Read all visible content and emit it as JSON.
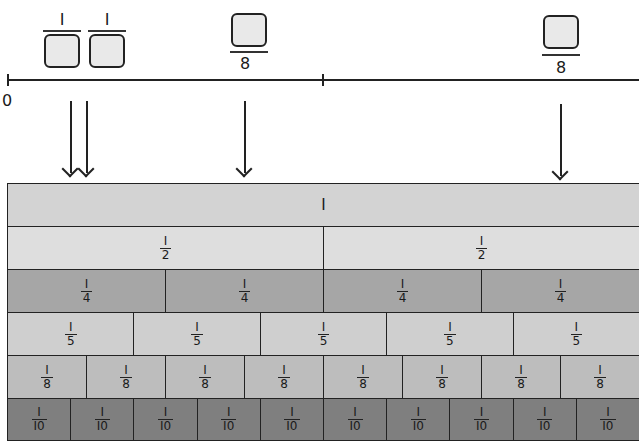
{
  "number_line": {
    "start_label": "0",
    "labels_above": [
      {
        "type": "unit-fraction-unknown-denominator",
        "numerator": "I",
        "x": 62
      },
      {
        "type": "unit-fraction-unknown-denominator",
        "numerator": "I",
        "x": 107
      },
      {
        "type": "unknown-numerator-eighths",
        "denominator": "8",
        "x": 244
      },
      {
        "type": "unknown-numerator-eighths",
        "denominator": "8",
        "x": 560
      }
    ]
  },
  "fraction_wall": {
    "rows": [
      {
        "label": "I",
        "count": 1,
        "color": "#d3d3d3",
        "denominator": ""
      },
      {
        "label": "I",
        "count": 2,
        "color": "#dedede",
        "denominator": "2"
      },
      {
        "label": "I",
        "count": 4,
        "color": "#a6a6a6",
        "denominator": "4"
      },
      {
        "label": "I",
        "count": 5,
        "color": "#cfcfcf",
        "denominator": "5"
      },
      {
        "label": "I",
        "count": 8,
        "color": "#bdbdbd",
        "denominator": "8"
      },
      {
        "label": "I",
        "count": 10,
        "color": "#7f7f7f",
        "denominator": "I0"
      }
    ]
  }
}
